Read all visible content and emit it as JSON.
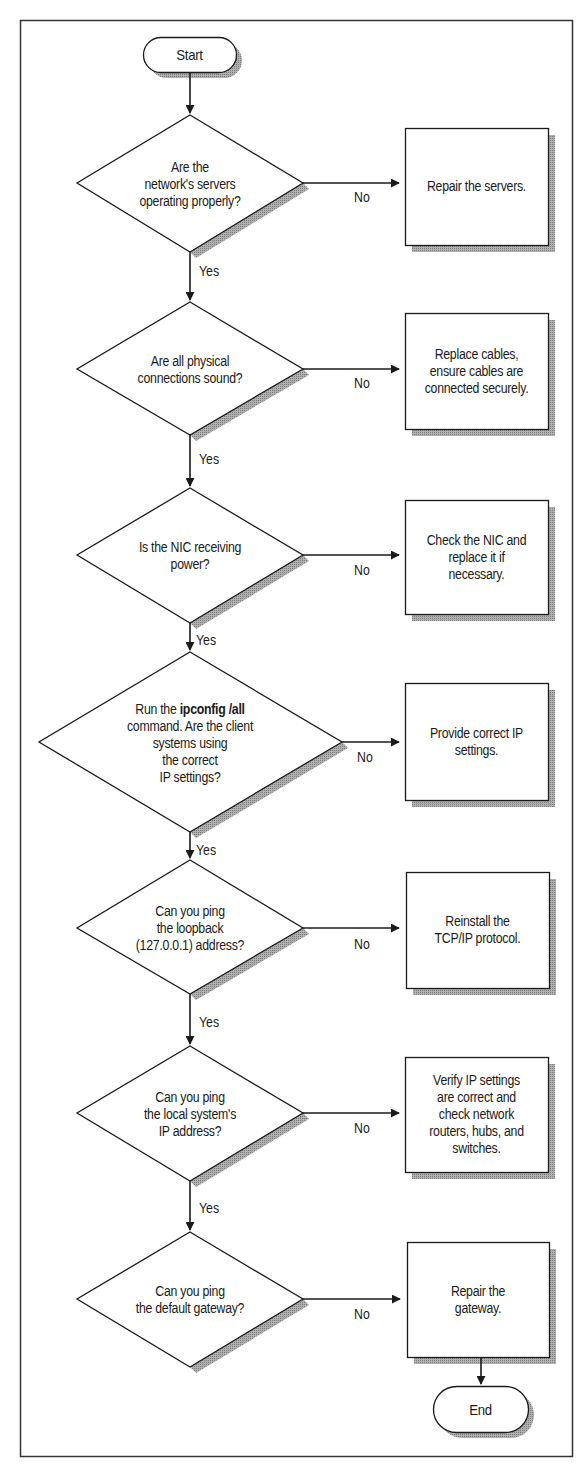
{
  "diagram": {
    "type": "flowchart",
    "colors": {
      "stroke": "#1a1a1a",
      "shadow": "#9a9a9a",
      "fill": "#ffffff",
      "frame": "#333333"
    },
    "start": {
      "label": "Start"
    },
    "end": {
      "label": "End"
    },
    "edge_labels": {
      "yes": "Yes",
      "no": "No"
    },
    "steps": [
      {
        "decision_lines": [
          "Are the",
          "network's servers",
          "operating properly?"
        ],
        "action_lines": [
          "Repair the servers."
        ]
      },
      {
        "decision_lines": [
          "Are all physical",
          "connections sound?"
        ],
        "action_lines": [
          "Replace cables,",
          "ensure cables are",
          "connected securely."
        ]
      },
      {
        "decision_lines": [
          "Is the NIC receiving",
          "power?"
        ],
        "action_lines": [
          "Check the NIC and",
          "replace it if",
          "necessary."
        ]
      },
      {
        "decision_prefix": "Run the ",
        "decision_bold": "ipconfig /all",
        "decision_lines": [
          "command. Are the client",
          "systems using",
          "the correct",
          "IP settings?"
        ],
        "action_lines": [
          "Provide correct IP",
          "settings."
        ]
      },
      {
        "decision_lines": [
          "Can you ping",
          "the loopback",
          "(127.0.0.1) address?"
        ],
        "action_lines": [
          "Reinstall the",
          "TCP/IP protocol."
        ]
      },
      {
        "decision_lines": [
          "Can you ping",
          "the local system's",
          "IP address?"
        ],
        "action_lines": [
          "Verify IP settings",
          "are correct and",
          "check network",
          "routers, hubs, and",
          "switches."
        ]
      },
      {
        "decision_lines": [
          "Can you ping",
          "the default gateway?"
        ],
        "action_lines": [
          "Repair the",
          "gateway."
        ]
      }
    ]
  }
}
